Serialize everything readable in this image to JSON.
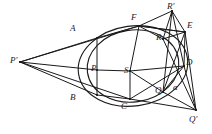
{
  "figure": {
    "background": "#ffffff",
    "stroke": "#1a1a1a",
    "width": 212,
    "height": 134
  },
  "labels": [
    {
      "key": "P_prime",
      "text": "P′",
      "x": 10,
      "y": 56,
      "desc": "external-left-pole"
    },
    {
      "key": "A",
      "text": "A",
      "x": 70,
      "y": 24,
      "desc": "hexagon-vertex-upper-left"
    },
    {
      "key": "F",
      "text": "F",
      "x": 131,
      "y": 13,
      "desc": "hexagon-vertex-top"
    },
    {
      "key": "R_prime",
      "text": "R′",
      "x": 167,
      "y": 2,
      "desc": "external-top-pole"
    },
    {
      "key": "E",
      "text": "E",
      "x": 187,
      "y": 21,
      "desc": "hexagon-vertex-upper-right"
    },
    {
      "key": "R",
      "text": "R",
      "x": 156,
      "y": 33,
      "desc": "interior-point-r"
    },
    {
      "key": "D",
      "text": "D",
      "x": 186,
      "y": 58,
      "desc": "hexagon-vertex-right"
    },
    {
      "key": "P",
      "text": "P",
      "x": 91,
      "y": 64,
      "desc": "interior-point-p"
    },
    {
      "key": "S",
      "text": "S",
      "x": 124,
      "y": 66,
      "desc": "center-point"
    },
    {
      "key": "B",
      "text": "B",
      "x": 70,
      "y": 93,
      "desc": "hexagon-vertex-lower-left"
    },
    {
      "key": "C",
      "text": "C",
      "x": 121,
      "y": 102,
      "desc": "hexagon-vertex-bottom"
    },
    {
      "key": "Q",
      "text": "Q",
      "x": 155,
      "y": 86,
      "desc": "interior-point-q"
    },
    {
      "key": "alpha",
      "text": "α",
      "x": 173,
      "y": 83,
      "desc": "angle-alpha"
    },
    {
      "key": "Q_prime",
      "text": "Q′",
      "x": 189,
      "y": 115,
      "desc": "external-bottom-right-pole"
    }
  ],
  "points": {
    "P_prime": {
      "x": 20,
      "y": 62
    },
    "A": {
      "x": 97,
      "y": 38
    },
    "F": {
      "x": 139,
      "y": 26
    },
    "R_prime": {
      "x": 172,
      "y": 11
    },
    "E": {
      "x": 185,
      "y": 32
    },
    "R": {
      "x": 163,
      "y": 39
    },
    "D": {
      "x": 184,
      "y": 66
    },
    "P": {
      "x": 97,
      "y": 70
    },
    "S": {
      "x": 130,
      "y": 71
    },
    "B": {
      "x": 97,
      "y": 95
    },
    "C": {
      "x": 130,
      "y": 99
    },
    "Q": {
      "x": 163,
      "y": 92
    },
    "Q_prime": {
      "x": 196,
      "y": 110
    }
  },
  "shapes": {
    "circle": {
      "cx": 133,
      "cy": 66,
      "rx": 55,
      "ry": 40,
      "rot": -8
    },
    "ellipse": {
      "cx": 133,
      "cy": 66,
      "rx": 46,
      "ry": 36,
      "rot": -8
    }
  },
  "segments": [
    [
      "P_prime",
      "A"
    ],
    [
      "P_prime",
      "F"
    ],
    [
      "P_prime",
      "B"
    ],
    [
      "P_prime",
      "C"
    ],
    [
      "P_prime",
      "P"
    ],
    [
      "P",
      "S"
    ],
    [
      "S",
      "D"
    ],
    [
      "A",
      "B"
    ],
    [
      "A",
      "F"
    ],
    [
      "F",
      "E"
    ],
    [
      "E",
      "D"
    ],
    [
      "D",
      "C"
    ],
    [
      "C",
      "B"
    ],
    [
      "F",
      "S"
    ],
    [
      "S",
      "Q"
    ],
    [
      "S",
      "C"
    ],
    [
      "R_prime",
      "F"
    ],
    [
      "R_prime",
      "E"
    ],
    [
      "R_prime",
      "R"
    ],
    [
      "R_prime",
      "Q"
    ],
    [
      "R_prime",
      "D"
    ],
    [
      "F",
      "E"
    ],
    [
      "F",
      "R"
    ],
    [
      "R",
      "E"
    ],
    [
      "Q_prime",
      "D"
    ],
    [
      "Q_prime",
      "E"
    ],
    [
      "Q_prime",
      "Q"
    ],
    [
      "Q_prime",
      "C"
    ],
    [
      "Q_prime",
      "R"
    ],
    [
      "Q",
      "D"
    ],
    [
      "Q",
      "E"
    ]
  ]
}
